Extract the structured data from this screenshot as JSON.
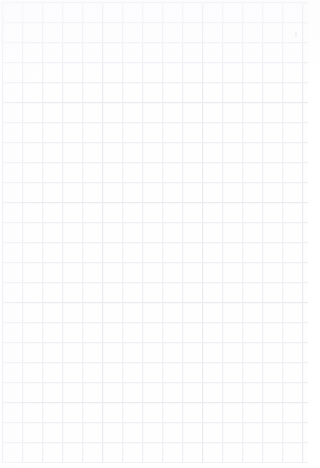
{
  "document": {
    "kind": "grid-paper-sheet",
    "title": "Blank grid paper",
    "content_text": "",
    "width_px": 320,
    "height_px": 468
  },
  "sheet": {
    "paper_color": "#fefeff",
    "background_color": "#ffffff"
  },
  "grid": {
    "cell_size_px": 20,
    "major_cell_size_px": 100,
    "line_color": "#ededf2",
    "line_color_soft": "#f5f5f8",
    "line_color_strong": "#e6e6ec",
    "origin_x_px": 2,
    "origin_y_px": 2,
    "grid_width_px": 306,
    "grid_height_px": 461,
    "columns": 15,
    "rows": 23,
    "margin_right_px": 12,
    "margin_bottom_px": 5
  },
  "marks": {
    "stray": {
      "label": "faint-speck",
      "x_px": 295,
      "y_px": 32,
      "width_px": 2,
      "height_px": 5,
      "color": "#dededf"
    }
  }
}
